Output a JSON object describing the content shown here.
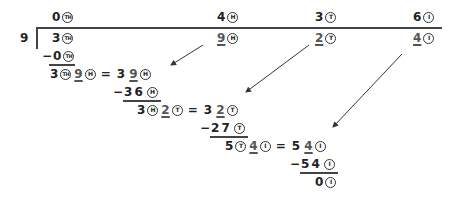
{
  "divisor": "9",
  "quotient": [
    {
      "digit": "0",
      "place": "TH"
    },
    {
      "digit": "4",
      "place": "H"
    },
    {
      "digit": "3",
      "place": "T"
    },
    {
      "digit": "6",
      "place": "I"
    }
  ],
  "dividend": [
    {
      "digit": "3",
      "place": "TH"
    },
    {
      "digit": "9",
      "place": "H"
    },
    {
      "digit": "2",
      "place": "T"
    },
    {
      "digit": "4",
      "place": "I"
    }
  ],
  "steps": [
    {
      "subtract": {
        "minus": "−",
        "value": "0",
        "place": "TH"
      },
      "regroup": {
        "left_digit": "3",
        "left_place": "TH",
        "carried_digit": "9",
        "carried_place": "H",
        "equals": "=",
        "result_tens": "3",
        "result_ones": "9",
        "result_place": "H"
      }
    },
    {
      "subtract": {
        "minus": "−",
        "value": "36",
        "place": "H"
      },
      "regroup": {
        "left_digit": "3",
        "left_place": "H",
        "carried_digit": "2",
        "carried_place": "T",
        "equals": "=",
        "result_tens": "3",
        "result_ones": "2",
        "result_place": "T"
      }
    },
    {
      "subtract": {
        "minus": "−",
        "value": "27",
        "place": "T"
      },
      "regroup": {
        "left_digit": "5",
        "left_place": "T",
        "carried_digit": "4",
        "carried_place": "I",
        "equals": "=",
        "result_tens": "5",
        "result_ones": "4",
        "result_place": "I"
      }
    },
    {
      "subtract": {
        "minus": "−",
        "value": "54",
        "place": "I"
      },
      "remainder": {
        "value": "0",
        "place": "I"
      }
    }
  ],
  "colors": {
    "ink": "#222222",
    "underline_digit": "#555555",
    "line": "#444444"
  }
}
